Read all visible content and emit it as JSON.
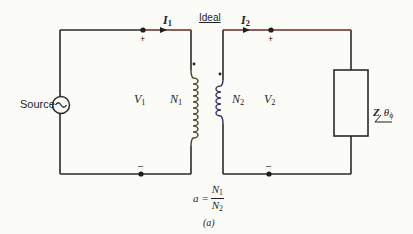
{
  "diagram": {
    "type": "ideal-transformer-circuit",
    "colors": {
      "background": "#fbfbf8",
      "wire": "#2a2a2a",
      "wire_top_accent": "#7a2626",
      "coil_primary": "#8a5a2a",
      "coil_secondary": "#3a3a8a",
      "text": "#1e1e1e"
    },
    "labels": {
      "source": "Source",
      "ideal": "Ideal",
      "i1_symbol": "I",
      "i1_sub": "1",
      "i2_symbol": "I",
      "i2_sub": "2",
      "v1_symbol": "V",
      "v1_sub": "1",
      "v2_symbol": "V",
      "v2_sub": "2",
      "n1_symbol": "N",
      "n1_sub": "1",
      "n2_symbol": "N",
      "n2_sub": "2",
      "plus_primary": "+",
      "minus_primary": "–",
      "plus_secondary": "+",
      "minus_secondary": "–",
      "load_z": "Z",
      "load_angle": "θ",
      "load_angle_sub": "ϕ",
      "ratio_lhs": "a =",
      "ratio_num_symbol": "N",
      "ratio_num_sub": "1",
      "ratio_den_symbol": "N",
      "ratio_den_sub": "2",
      "caption": "(a)"
    },
    "components": [
      {
        "name": "ac-source",
        "symbol": "~"
      },
      {
        "name": "primary-winding",
        "turns_label": "N1",
        "polarity_dot": true
      },
      {
        "name": "secondary-winding",
        "turns_label": "N2",
        "polarity_dot": true
      },
      {
        "name": "load-impedance",
        "label": "Z/θϕ"
      }
    ]
  }
}
